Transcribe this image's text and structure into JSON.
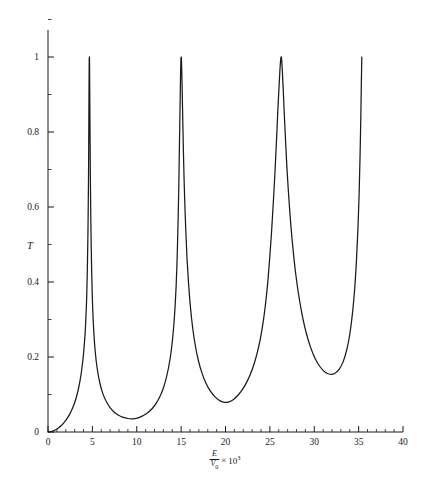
{
  "chart_data": {
    "type": "line",
    "title": "",
    "subtitle": "",
    "xlabel_parts": {
      "numerator": "E",
      "denominator": "V",
      "denominator_sub": "0",
      "multiplier_symbol": "×",
      "power_base": "10",
      "power_exponent": "3"
    },
    "xlabel": "E/V0 × 10^3",
    "ylabel": "T",
    "xlim": [
      0,
      40
    ],
    "ylim": [
      0,
      1
    ],
    "grid": false,
    "legend": "none",
    "x_major_ticks": [
      0,
      5,
      10,
      15,
      20,
      25,
      30,
      35,
      40
    ],
    "x_tick_labels": [
      "0",
      "5",
      "10",
      "15",
      "20",
      "25",
      "30",
      "35",
      "40"
    ],
    "x_minor_ticks": [
      1,
      2,
      3,
      4,
      6,
      7,
      8,
      9,
      11,
      12,
      13,
      14,
      16,
      17,
      18,
      19,
      21,
      22,
      23,
      24,
      26,
      27,
      28,
      29,
      31,
      32,
      33,
      34,
      36,
      37,
      38,
      39
    ],
    "y_major_ticks": [
      0,
      0.2,
      0.4,
      0.6,
      0.8,
      1
    ],
    "y_tick_labels": [
      "0",
      "0.2",
      "0.4",
      "0.6",
      "0.8",
      "1"
    ],
    "y_minor_ticks": [
      0.1,
      0.3,
      0.5,
      0.7,
      0.9,
      1.1
    ],
    "series": [
      {
        "name": "T",
        "color": "#1a1a1a",
        "resonance_peaks_x": [
          4.6,
          14.6,
          24.9,
          35.2
        ],
        "resonance_peak_value": 1.0,
        "minima_x": [
          9.4,
          19.5,
          30.0
        ],
        "minima_values": [
          0.035,
          0.072,
          0.105
        ],
        "x_start": 0.0,
        "x_end": 35.3,
        "y_at_x_start": 0.0,
        "points": [
          [
            0.0,
            0.0
          ],
          [
            0.3,
            0.0008
          ],
          [
            0.6,
            0.003
          ],
          [
            0.9,
            0.0065
          ],
          [
            1.2,
            0.0112
          ],
          [
            1.5,
            0.0172
          ],
          [
            1.8,
            0.0248
          ],
          [
            2.1,
            0.0341
          ],
          [
            2.4,
            0.0456
          ],
          [
            2.7,
            0.06
          ],
          [
            3.0,
            0.0782
          ],
          [
            3.2,
            0.0934
          ],
          [
            3.4,
            0.112
          ],
          [
            3.6,
            0.1355
          ],
          [
            3.8,
            0.166
          ],
          [
            4.0,
            0.208
          ],
          [
            4.15,
            0.252
          ],
          [
            4.25,
            0.293
          ],
          [
            4.35,
            0.353
          ],
          [
            4.42,
            0.418
          ],
          [
            4.48,
            0.498
          ],
          [
            4.52,
            0.57
          ],
          [
            4.56,
            0.665
          ],
          [
            4.58,
            0.73
          ],
          [
            4.6,
            0.815
          ],
          [
            4.62,
            0.91
          ],
          [
            4.64,
            0.98
          ],
          [
            4.66,
            1.0
          ],
          [
            4.68,
            0.985
          ],
          [
            4.7,
            0.92
          ],
          [
            4.73,
            0.815
          ],
          [
            4.76,
            0.72
          ],
          [
            4.8,
            0.62
          ],
          [
            4.85,
            0.525
          ],
          [
            4.92,
            0.43
          ],
          [
            5.0,
            0.355
          ],
          [
            5.12,
            0.285
          ],
          [
            5.3,
            0.22
          ],
          [
            5.55,
            0.168
          ],
          [
            5.85,
            0.13
          ],
          [
            6.2,
            0.101
          ],
          [
            6.6,
            0.08
          ],
          [
            7.0,
            0.065
          ],
          [
            7.5,
            0.052
          ],
          [
            8.0,
            0.044
          ],
          [
            8.5,
            0.039
          ],
          [
            9.0,
            0.036
          ],
          [
            9.4,
            0.035
          ],
          [
            9.8,
            0.0358
          ],
          [
            10.3,
            0.039
          ],
          [
            10.8,
            0.0445
          ],
          [
            11.3,
            0.0525
          ],
          [
            11.8,
            0.064
          ],
          [
            12.2,
            0.077
          ],
          [
            12.6,
            0.094
          ],
          [
            12.95,
            0.114
          ],
          [
            13.25,
            0.137
          ],
          [
            13.55,
            0.168
          ],
          [
            13.8,
            0.202
          ],
          [
            14.0,
            0.24
          ],
          [
            14.18,
            0.286
          ],
          [
            14.32,
            0.335
          ],
          [
            14.44,
            0.39
          ],
          [
            14.54,
            0.455
          ],
          [
            14.62,
            0.525
          ],
          [
            14.7,
            0.61
          ],
          [
            14.76,
            0.69
          ],
          [
            14.82,
            0.78
          ],
          [
            14.88,
            0.87
          ],
          [
            14.93,
            0.945
          ],
          [
            14.97,
            0.988
          ],
          [
            15.0,
            1.0
          ],
          [
            15.04,
            0.99
          ],
          [
            15.09,
            0.945
          ],
          [
            15.15,
            0.875
          ],
          [
            15.22,
            0.79
          ],
          [
            15.3,
            0.705
          ],
          [
            15.4,
            0.62
          ],
          [
            15.52,
            0.54
          ],
          [
            15.66,
            0.465
          ],
          [
            15.84,
            0.395
          ],
          [
            16.05,
            0.333
          ],
          [
            16.3,
            0.278
          ],
          [
            16.6,
            0.23
          ],
          [
            16.95,
            0.19
          ],
          [
            17.35,
            0.157
          ],
          [
            17.8,
            0.13
          ],
          [
            18.3,
            0.109
          ],
          [
            18.85,
            0.093
          ],
          [
            19.4,
            0.083
          ],
          [
            19.9,
            0.079
          ],
          [
            20.4,
            0.0805
          ],
          [
            20.9,
            0.087
          ],
          [
            21.4,
            0.098
          ],
          [
            21.9,
            0.113
          ],
          [
            22.35,
            0.131
          ],
          [
            22.8,
            0.154
          ],
          [
            23.2,
            0.18
          ],
          [
            23.55,
            0.209
          ],
          [
            23.88,
            0.243
          ],
          [
            24.15,
            0.279
          ],
          [
            24.4,
            0.32
          ],
          [
            24.62,
            0.365
          ],
          [
            24.82,
            0.415
          ],
          [
            25.0,
            0.47
          ],
          [
            25.18,
            0.53
          ],
          [
            25.34,
            0.593
          ],
          [
            25.5,
            0.66
          ],
          [
            25.64,
            0.725
          ],
          [
            25.78,
            0.795
          ],
          [
            25.9,
            0.858
          ],
          [
            26.02,
            0.915
          ],
          [
            26.12,
            0.96
          ],
          [
            26.2,
            0.988
          ],
          [
            26.26,
            1.0
          ],
          [
            26.32,
            0.995
          ],
          [
            26.4,
            0.965
          ],
          [
            26.5,
            0.915
          ],
          [
            26.62,
            0.85
          ],
          [
            26.76,
            0.78
          ],
          [
            26.92,
            0.705
          ],
          [
            27.12,
            0.63
          ],
          [
            27.35,
            0.555
          ],
          [
            27.62,
            0.485
          ],
          [
            27.92,
            0.42
          ],
          [
            28.28,
            0.36
          ],
          [
            28.68,
            0.307
          ],
          [
            29.12,
            0.262
          ],
          [
            29.6,
            0.225
          ],
          [
            30.1,
            0.196
          ],
          [
            30.65,
            0.174
          ],
          [
            31.2,
            0.16
          ],
          [
            31.75,
            0.154
          ],
          [
            32.3,
            0.156
          ],
          [
            32.8,
            0.167
          ],
          [
            33.25,
            0.187
          ],
          [
            33.65,
            0.218
          ],
          [
            34.0,
            0.26
          ],
          [
            34.3,
            0.315
          ],
          [
            34.55,
            0.38
          ],
          [
            34.75,
            0.455
          ],
          [
            34.92,
            0.54
          ],
          [
            35.05,
            0.63
          ],
          [
            35.15,
            0.725
          ],
          [
            35.24,
            0.83
          ],
          [
            35.3,
            0.92
          ],
          [
            35.34,
            0.975
          ],
          [
            35.36,
            1.0
          ]
        ]
      }
    ]
  },
  "axes": {
    "x_axis_name": "x-axis",
    "y_axis_name": "y-axis"
  }
}
